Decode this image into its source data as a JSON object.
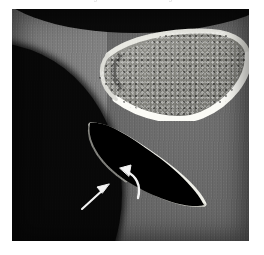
{
  "caption": {
    "text": "Figure 2. Axial CT image",
    "note": "clipped at top edge, illegible"
  },
  "image": {
    "modality_label": "ct-axial-slice",
    "frame": {
      "x": 12,
      "y": 9,
      "width": 237,
      "height": 232
    },
    "background_color": "#ffffff",
    "air_color": "#080808",
    "soft_tissue_color": "#5f5f5f",
    "cortical_bone_color": "#f2f2ee",
    "trabecular_bone_color": "#8a8a86",
    "annotation_color": "#f5f5f5"
  },
  "structures": [
    {
      "name": "upper-bone",
      "label": "curved bone with dense cortical margin and trabecular marrow",
      "position": "superior, center-right"
    },
    {
      "name": "lower-bone-fragment",
      "label": "wedge-shaped osseous fragment",
      "position": "inferior, center"
    },
    {
      "name": "air-soft-tissue-interface",
      "label": "skin surface / air boundary",
      "position": "left and inferior-left"
    }
  ],
  "annotations": [
    {
      "name": "straight-arrow",
      "type": "straight",
      "tail": {
        "x": 73,
        "y": 197
      },
      "head": {
        "x": 96,
        "y": 177
      },
      "points_to": "inferior cortical defect"
    },
    {
      "name": "curved-arrow",
      "type": "curved",
      "tail": {
        "x": 122,
        "y": 187
      },
      "head": {
        "x": 110,
        "y": 161
      },
      "points_to": "fracture line / marrow lesion"
    }
  ]
}
